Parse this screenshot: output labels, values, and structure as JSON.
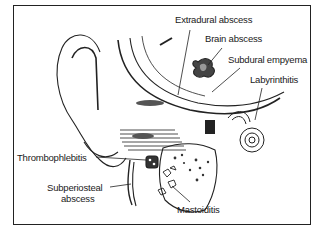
{
  "diagram": {
    "labels": [
      {
        "id": "extradural",
        "text": "Extradural abscess",
        "x": 175,
        "y": 20
      },
      {
        "id": "brain",
        "text": "Brain abscess",
        "x": 205,
        "y": 39
      },
      {
        "id": "subdural",
        "text": "Subdural empyema",
        "x": 228,
        "y": 60
      },
      {
        "id": "labyrinthitis",
        "text": "Labyrinthitis",
        "x": 250,
        "y": 80
      },
      {
        "id": "thrombophlebitis",
        "text": "Thrombophlebitis",
        "x": 17,
        "y": 152
      },
      {
        "id": "subperiosteal_1",
        "text": "Subperiosteal",
        "x": 47,
        "y": 183
      },
      {
        "id": "subperiosteal_2",
        "text": "abscess",
        "x": 61,
        "y": 194
      },
      {
        "id": "mastoiditis",
        "text": "Mastoiditis",
        "x": 177,
        "y": 204
      }
    ]
  }
}
